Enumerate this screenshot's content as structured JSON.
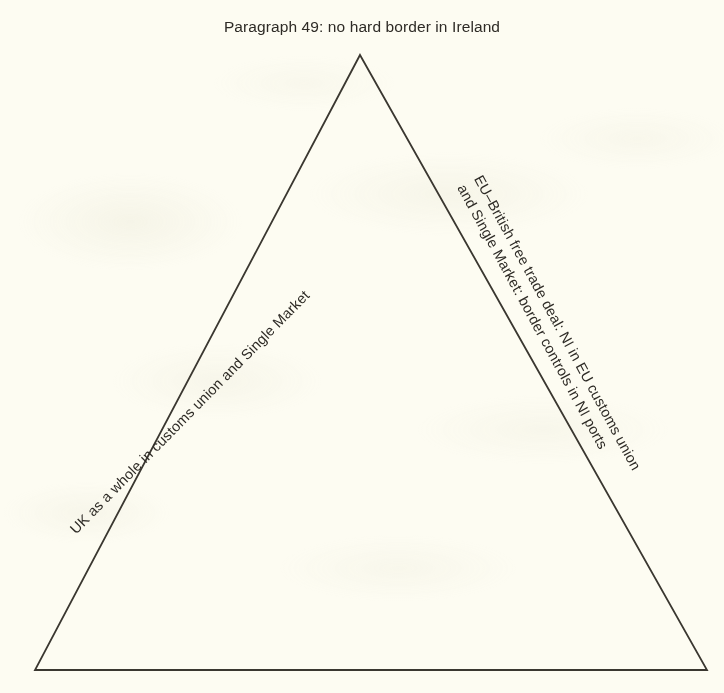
{
  "page": {
    "background_color": "#fdfcf2",
    "ink_color": "#2e2b26",
    "line_color": "#3a3730"
  },
  "diagram": {
    "title": "Paragraph 49: no hard border in Ireland",
    "shape": "triangle",
    "vertices": {
      "apex": "360,55",
      "bottom_left": "35,670",
      "bottom_right": "707,670"
    },
    "edges": {
      "left": {
        "label": "UK as a whole in customs union and Single Market"
      },
      "right": {
        "line1": "EU–British free trade deal: NI in EU customs union",
        "line2": "and Single Market: border controls in NI ports"
      },
      "bottom": {
        "label": ""
      }
    }
  }
}
